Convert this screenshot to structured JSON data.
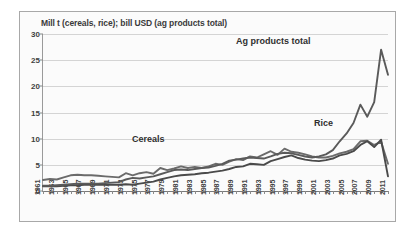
{
  "chart_data": {
    "type": "line",
    "title": "Mill t (cereals, rice); bill USD (ag products total)",
    "xlabel": "",
    "ylabel": "",
    "ylim": [
      0,
      30
    ],
    "yticks": [
      0,
      5,
      10,
      15,
      20,
      25,
      30
    ],
    "grid": true,
    "legend_position": "inline-annotations",
    "x": [
      1961,
      1962,
      1963,
      1964,
      1965,
      1966,
      1967,
      1968,
      1969,
      1970,
      1971,
      1972,
      1973,
      1974,
      1975,
      1976,
      1977,
      1978,
      1979,
      1980,
      1981,
      1982,
      1983,
      1984,
      1985,
      1986,
      1987,
      1988,
      1989,
      1990,
      1991,
      1992,
      1993,
      1994,
      1995,
      1996,
      1997,
      1998,
      1999,
      2000,
      2001,
      2002,
      2003,
      2004,
      2005,
      2006,
      2007,
      2008,
      2009,
      2010,
      2011
    ],
    "xtick_labels": [
      1961,
      1963,
      1965,
      1967,
      1969,
      1971,
      1973,
      1975,
      1977,
      1979,
      1981,
      1983,
      1985,
      1987,
      1989,
      1991,
      1993,
      1995,
      1997,
      1999,
      2001,
      2003,
      2005,
      2007,
      2009,
      2011
    ],
    "series": [
      {
        "name": "Cereals",
        "color": "#6b6b6b",
        "values": [
          2.1,
          2.3,
          2.2,
          2.6,
          3.0,
          3.1,
          3.0,
          3.0,
          2.9,
          2.8,
          2.7,
          2.6,
          3.4,
          3.0,
          3.4,
          3.6,
          3.3,
          4.4,
          4.0,
          4.3,
          4.7,
          4.4,
          4.6,
          4.4,
          4.7,
          5.2,
          5.0,
          5.6,
          6.1,
          5.9,
          6.6,
          6.4,
          7.0,
          7.6,
          6.9,
          8.1,
          7.5,
          7.3,
          7.0,
          6.6,
          6.4,
          6.4,
          6.7,
          7.2,
          7.5,
          8.0,
          9.5,
          9.6,
          8.8,
          9.4,
          5.2
        ]
      },
      {
        "name": "Rice",
        "color": "#4a4a4a",
        "values": [
          0.9,
          0.9,
          0.9,
          1.0,
          1.1,
          1.1,
          1.2,
          1.2,
          1.2,
          1.2,
          1.2,
          1.2,
          1.3,
          1.2,
          1.4,
          1.6,
          1.8,
          2.2,
          2.5,
          2.8,
          3.0,
          3.1,
          3.2,
          3.4,
          3.5,
          3.7,
          3.9,
          4.2,
          4.6,
          4.7,
          5.2,
          5.1,
          5.0,
          5.7,
          6.1,
          6.5,
          6.8,
          6.3,
          6.0,
          5.8,
          5.7,
          5.9,
          6.2,
          6.8,
          7.1,
          7.6,
          8.8,
          9.5,
          8.4,
          9.8,
          2.8
        ]
      },
      {
        "name": "Ag products total",
        "color": "#5a5a5a",
        "values": [
          1.0,
          1.0,
          1.1,
          1.2,
          1.3,
          1.4,
          1.4,
          1.4,
          1.4,
          1.5,
          1.6,
          1.7,
          2.2,
          2.5,
          2.4,
          2.6,
          2.8,
          3.2,
          3.6,
          4.0,
          4.1,
          4.0,
          4.2,
          4.4,
          4.5,
          4.8,
          5.2,
          5.8,
          6.0,
          6.2,
          6.4,
          6.3,
          6.2,
          6.6,
          7.1,
          7.3,
          7.2,
          6.9,
          6.6,
          6.4,
          6.6,
          7.0,
          7.8,
          9.5,
          11.0,
          13.0,
          16.5,
          14.2,
          17.0,
          27.0,
          22.2
        ]
      }
    ],
    "annotations": [
      {
        "text": "Ag products total",
        "near_year": 2002,
        "near_value": 25.5
      },
      {
        "text": "Rice",
        "near_year": 2007,
        "near_value": 11.5
      },
      {
        "text": "Cereals",
        "near_year": 1982,
        "near_value": 6.5
      }
    ]
  }
}
